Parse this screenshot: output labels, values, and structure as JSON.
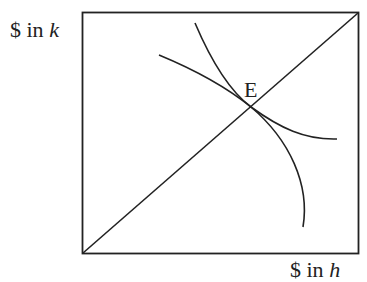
{
  "diagram": {
    "y_axis_label": {
      "prefix": "$ in ",
      "var": "k"
    },
    "x_axis_label": {
      "prefix": "$ in ",
      "var": "h"
    },
    "point_label": "E",
    "elements": [
      {
        "name": "box",
        "x0": 82,
        "y0": 12,
        "x1": 359,
        "y1": 254
      },
      {
        "name": "diagonal-line",
        "from": [
          82,
          254
        ],
        "to": [
          359,
          12
        ]
      },
      {
        "name": "steep-curve",
        "from": [
          195,
          23
        ],
        "through": [
          251,
          107
        ],
        "to": [
          303,
          227
        ]
      },
      {
        "name": "shallow-curve",
        "from": [
          159,
          55
        ],
        "through": [
          251,
          107
        ],
        "to": [
          337,
          139
        ]
      },
      {
        "name": "equilibrium-point",
        "at": [
          251,
          107
        ],
        "label": "E"
      }
    ],
    "stroke_color": "#222222"
  }
}
